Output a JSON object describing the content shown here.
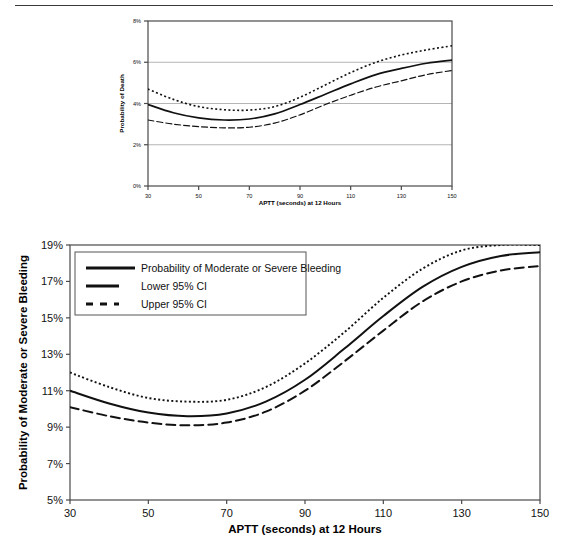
{
  "page": {
    "divider": "horizontal-rule"
  },
  "chart_data": [
    {
      "id": "top",
      "type": "line",
      "title": "",
      "xlabel": "APTT (seconds) at 12 Hours",
      "ylabel": "Probability of Death",
      "xlim": [
        30,
        150
      ],
      "ylim": [
        0,
        8
      ],
      "xticks": [
        30,
        50,
        70,
        90,
        110,
        130,
        150
      ],
      "xticklabels": [
        "30",
        "50",
        "70",
        "90",
        "110",
        "130",
        "150"
      ],
      "yticks": [
        0,
        2,
        4,
        6,
        8
      ],
      "yticklabels": [
        "0%",
        "2%",
        "4%",
        "6%",
        "8%"
      ],
      "grid": "horizontal",
      "legend": "none",
      "x": [
        30,
        40,
        50,
        60,
        70,
        80,
        90,
        100,
        110,
        120,
        130,
        140,
        150
      ],
      "series": [
        {
          "name": "Probability of Death",
          "style": "solid",
          "values": [
            3.95,
            3.55,
            3.3,
            3.2,
            3.25,
            3.5,
            3.95,
            4.45,
            4.95,
            5.4,
            5.7,
            5.95,
            6.1
          ]
        },
        {
          "name": "Lower 95% CI",
          "style": "dashed",
          "values": [
            3.2,
            3.0,
            2.88,
            2.82,
            2.85,
            3.05,
            3.45,
            3.95,
            4.4,
            4.8,
            5.1,
            5.4,
            5.6
          ]
        },
        {
          "name": "Upper 95% CI",
          "style": "dotted",
          "values": [
            4.7,
            4.2,
            3.85,
            3.7,
            3.68,
            3.85,
            4.3,
            4.9,
            5.5,
            6.0,
            6.35,
            6.6,
            6.8
          ]
        }
      ]
    },
    {
      "id": "bottom",
      "type": "line",
      "title": "",
      "xlabel": "APTT (seconds) at 12 Hours",
      "ylabel": "Probability of Moderate or Severe Bleeding",
      "xlim": [
        30,
        150
      ],
      "ylim": [
        5,
        19
      ],
      "xticks": [
        30,
        50,
        70,
        90,
        110,
        130,
        150
      ],
      "xticklabels": [
        "30",
        "50",
        "70",
        "90",
        "110",
        "130",
        "150"
      ],
      "yticks": [
        5,
        7,
        9,
        11,
        13,
        15,
        17,
        19
      ],
      "yticklabels": [
        "5%",
        "7%",
        "9%",
        "11%",
        "13%",
        "15%",
        "17%",
        "19%"
      ],
      "grid": "none",
      "legend": "inside-top-left",
      "x": [
        30,
        40,
        50,
        60,
        70,
        80,
        90,
        100,
        110,
        120,
        130,
        140,
        150
      ],
      "series": [
        {
          "name": "Probability of Moderate or Severe Bleeding",
          "style": "solid",
          "values": [
            11.0,
            10.3,
            9.8,
            9.6,
            9.75,
            10.4,
            11.6,
            13.3,
            15.1,
            16.7,
            17.8,
            18.4,
            18.6
          ]
        },
        {
          "name": "Lower 95% CI",
          "style": "long-dashed",
          "values": [
            10.1,
            9.6,
            9.25,
            9.1,
            9.25,
            9.85,
            11.0,
            12.6,
            14.3,
            15.9,
            17.0,
            17.6,
            17.85
          ]
        },
        {
          "name": "Upper 95% CI",
          "style": "dotted",
          "values": [
            12.0,
            11.2,
            10.6,
            10.4,
            10.5,
            11.2,
            12.5,
            14.2,
            16.1,
            17.7,
            18.7,
            19.0,
            19.0
          ]
        }
      ]
    }
  ],
  "legend": {
    "items": [
      {
        "label": "Probability of Moderate or Severe Bleeding",
        "style": "solid"
      },
      {
        "label": "Lower 95% CI",
        "style": "medium-dash"
      },
      {
        "label": "Upper 95% CI",
        "style": "short-dash"
      }
    ]
  }
}
